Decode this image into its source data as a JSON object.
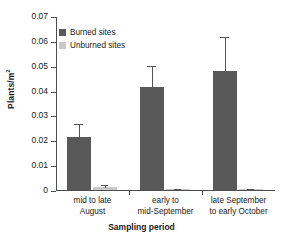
{
  "chart_data": {
    "type": "bar",
    "title": "",
    "xlabel": "Sampling period",
    "ylabel": "Plants/m2",
    "ylabel_base": "Plants/m",
    "ylabel_exp": "2",
    "categories": [
      "mid to late August",
      "early to mid-September",
      "late September to early October"
    ],
    "category_lines": [
      [
        "mid to late",
        "August"
      ],
      [
        "early to",
        "mid-September"
      ],
      [
        "late September",
        "to early October"
      ]
    ],
    "series": [
      {
        "name": "Burned sites",
        "color": "#595959",
        "values": [
          0.0215,
          0.0415,
          0.048
        ],
        "errors": [
          0.005,
          0.0085,
          0.0135
        ]
      },
      {
        "name": "Unburned sites",
        "color": "#c8c8c8",
        "values": [
          0.0012,
          0.0004,
          0.0004
        ],
        "errors": [
          0.0007,
          0.0002,
          0.0002
        ]
      }
    ],
    "ylim": [
      0,
      0.07
    ],
    "ytick_values": [
      0,
      0.01,
      0.02,
      0.03,
      0.04,
      0.05,
      0.06,
      0.07
    ],
    "ytick_labels": [
      "0",
      "0.01",
      "0.02",
      "0.03",
      "0.04",
      "0.05",
      "0.06",
      "0.07"
    ],
    "grid": false,
    "legend_position": "top-left",
    "legend": [
      "Burned sites",
      "Unburned sites"
    ],
    "axis_color": "#4d4d4d",
    "error_bar_color": "#555555"
  }
}
